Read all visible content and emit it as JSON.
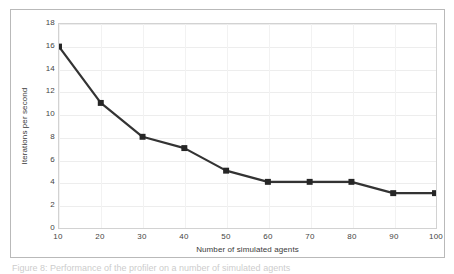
{
  "figure": {
    "caption": "Figure 8: Performance of the profiler on a number of simulated agents"
  },
  "chart_data": {
    "type": "line",
    "title": "",
    "subtitle": "",
    "xlabel": "Number of simulated agents",
    "ylabel": "Iterations per second",
    "x": [
      10,
      20,
      30,
      40,
      50,
      60,
      70,
      80,
      90,
      100
    ],
    "values": [
      16,
      11,
      8,
      7,
      5,
      4,
      4,
      4,
      3,
      3
    ],
    "series": [
      {
        "name": "Iterations per second",
        "values": [
          16,
          11,
          8,
          7,
          5,
          4,
          4,
          4,
          3,
          3
        ]
      }
    ],
    "xlim": [
      10,
      100
    ],
    "ylim": [
      0,
      18
    ],
    "xticks": [
      "10",
      "20",
      "30",
      "40",
      "50",
      "60",
      "70",
      "80",
      "90",
      "100"
    ],
    "yticks": [
      "0",
      "2",
      "4",
      "6",
      "8",
      "10",
      "12",
      "14",
      "16",
      "18"
    ],
    "xtick_values": [
      10,
      20,
      30,
      40,
      50,
      60,
      70,
      80,
      90,
      100
    ],
    "ytick_values": [
      0,
      2,
      4,
      6,
      8,
      10,
      12,
      14,
      16,
      18
    ],
    "grid": true,
    "grid_axis": "y",
    "legend": false,
    "legend_position": "none",
    "marker": "square",
    "line_color": "#333333",
    "marker_color": "#262626",
    "grid_color": "#ededed",
    "plot_border_color": "#d2d2d2",
    "frame_border_color": "#b9b9b9",
    "background_color": "#ffffff",
    "line_width": 2.2,
    "marker_size": 6
  }
}
